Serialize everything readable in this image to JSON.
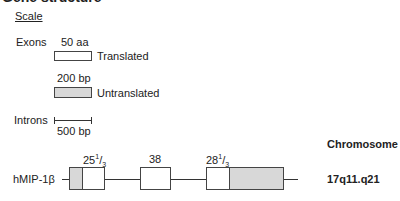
{
  "heading": "Gene structure",
  "scale": {
    "title": "Scale",
    "exons_label": "Exons",
    "translated_size": "50 aa",
    "translated_label": "Translated",
    "untranslated_size": "200 bp",
    "untranslated_label": "Untranslated",
    "introns_label": "Introns",
    "intron_size": "500 bp"
  },
  "gene": {
    "name": "hMIP-1β",
    "exons": [
      {
        "whole": "25",
        "num": "1",
        "den": "3"
      },
      {
        "whole": "38",
        "num": "",
        "den": ""
      },
      {
        "whole": "28",
        "num": "1",
        "den": "3"
      }
    ]
  },
  "chromosome": {
    "header": "Chromosome",
    "location": "17q11.q21"
  },
  "colors": {
    "untranslated_fill": "#d8d8d8",
    "translated_fill": "#ffffff",
    "stroke": "#444444"
  }
}
